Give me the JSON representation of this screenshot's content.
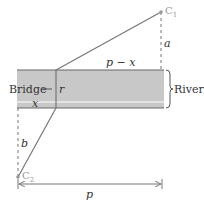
{
  "diagram": {
    "colors": {
      "river_fill": "#c8c8c8",
      "line": "#777777",
      "point": "#999999",
      "text": "#333333"
    },
    "labels": {
      "c1": "C",
      "c1_sub": "1",
      "c2": "C",
      "c2_sub": "2",
      "a": "a",
      "b": "b",
      "p_minus_x": "p − x",
      "x": "x",
      "r": "r",
      "bridge": "Bridge",
      "river": "River",
      "p": "p"
    }
  }
}
